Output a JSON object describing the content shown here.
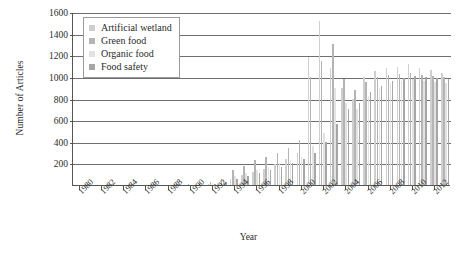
{
  "chart_data": {
    "type": "bar",
    "title": "",
    "xlabel": "Year",
    "ylabel": "Number of Articles",
    "ylim": [
      0,
      1600
    ],
    "yticks": [
      200,
      400,
      600,
      800,
      1000,
      1200,
      1400,
      1600
    ],
    "grid": true,
    "legend_position": "top-left inside plot",
    "xtick_labels": [
      "1980",
      "1982",
      "1984",
      "1986",
      "1988",
      "1990",
      "1992",
      "1994",
      "1996",
      "1998",
      "2000",
      "2002",
      "2004",
      "2006",
      "2008",
      "2010",
      "2012"
    ],
    "categories": [
      "1980",
      "1981",
      "1982",
      "1983",
      "1984",
      "1985",
      "1986",
      "1987",
      "1988",
      "1989",
      "1990",
      "1991",
      "1992",
      "1993",
      "1994",
      "1995",
      "1996",
      "1997",
      "1998",
      "1999",
      "2000",
      "2001",
      "2002",
      "2003",
      "2004",
      "2005",
      "2006",
      "2007",
      "2008",
      "2009",
      "2010",
      "2011",
      "2012",
      "2013"
    ],
    "series": [
      {
        "name": "Artificial wetland",
        "color": "#cfcfcf",
        "values": [
          0,
          0,
          0,
          0,
          0,
          0,
          0,
          0,
          0,
          0,
          0,
          0,
          10,
          20,
          60,
          90,
          120,
          150,
          190,
          240,
          300,
          1180,
          1520,
          1080,
          900,
          800,
          1000,
          1050,
          1080,
          1090,
          1120,
          1080,
          1060,
          1040
        ]
      },
      {
        "name": "Green food",
        "color": "#b4b4b4",
        "values": [
          0,
          0,
          0,
          0,
          0,
          0,
          0,
          0,
          0,
          0,
          5,
          10,
          30,
          60,
          140,
          180,
          230,
          260,
          300,
          340,
          420,
          1000,
          1150,
          1300,
          980,
          880,
          950,
          1000,
          1020,
          1030,
          1040,
          1020,
          1010,
          1000
        ]
      },
      {
        "name": "Organic food",
        "color": "#e2e2e2",
        "values": [
          0,
          0,
          0,
          0,
          0,
          0,
          0,
          0,
          0,
          0,
          0,
          5,
          20,
          40,
          80,
          110,
          140,
          170,
          200,
          230,
          260,
          360,
          480,
          900,
          760,
          700,
          820,
          900,
          940,
          960,
          980,
          960,
          950,
          940
        ]
      },
      {
        "name": "Food safety",
        "color": "#a6a6a6",
        "values": [
          0,
          0,
          0,
          0,
          0,
          0,
          0,
          0,
          0,
          0,
          0,
          0,
          10,
          25,
          55,
          80,
          110,
          140,
          170,
          200,
          240,
          300,
          400,
          560,
          700,
          760,
          860,
          920,
          960,
          990,
          1010,
          1000,
          990,
          980
        ]
      }
    ]
  },
  "legend": {
    "items": [
      {
        "label": "Artificial wetland"
      },
      {
        "label": "Green food"
      },
      {
        "label": "Organic food"
      },
      {
        "label": "Food safety"
      }
    ]
  },
  "axis": {
    "y_title": "Number of Articles",
    "x_title": "Year"
  }
}
